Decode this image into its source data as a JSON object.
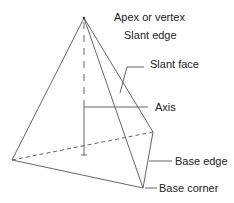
{
  "diagram": {
    "labels": {
      "apex": "Apex or vertex",
      "slant_edge": "Slant edge",
      "slant_face": "Slant face",
      "axis": "Axis",
      "base_edge": "Base edge",
      "base_corner": "Base corner"
    },
    "colors": {
      "line": "#555555",
      "text": "#222222",
      "background": "#ffffff"
    }
  }
}
